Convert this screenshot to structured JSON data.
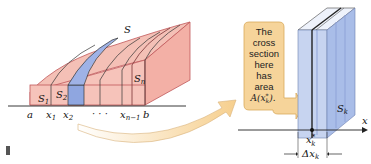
{
  "left_figure": {
    "solid_label": "S",
    "slab_labels": [
      "S",
      "S",
      "S"
    ],
    "slab_subscripts": [
      "1",
      "2",
      "n"
    ],
    "axis_labels": {
      "a": "a",
      "x1": "x",
      "x1_sub": "1",
      "x2": "x",
      "x2_sub": "2",
      "dots": "· · ·",
      "xn1": "x",
      "xn1_sub": "n−1",
      "b": "b"
    }
  },
  "callout": {
    "lines": [
      "The",
      "cross",
      "section",
      "here",
      "has",
      "area",
      "A(x*k)."
    ]
  },
  "right_figure": {
    "slab_label": "S",
    "slab_sub": "k",
    "axis_label": "x",
    "point_label": "x",
    "point_sup": "*",
    "point_sub": "k",
    "width_label": "Δx",
    "width_sub": "k"
  },
  "colors": {
    "solid_fill": "#f4b9b0",
    "solid_stroke": "#c0585a",
    "highlight_slab": "#8fa6e0",
    "slab_blue": "#a9bde8",
    "callout_fill": "#f6d49a",
    "callout_stroke": "#d9a95a"
  }
}
